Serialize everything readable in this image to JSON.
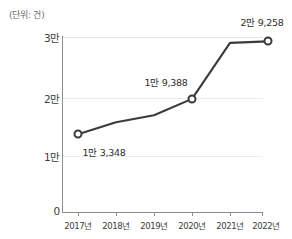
{
  "chart_data": {
    "type": "line",
    "title": "",
    "unit_note": "(단위: 건)",
    "xlabel": "",
    "ylabel": "",
    "grid": true,
    "legend": "none",
    "categories": [
      "2017년",
      "2018년",
      "2019년",
      "2020년",
      "2021년",
      "2022년"
    ],
    "series": [
      {
        "name": "건수",
        "values": [
          13348,
          15400,
          16600,
          19388,
          29000,
          29258
        ]
      }
    ],
    "ylim": [
      0,
      30000
    ],
    "ytick_values": [
      0,
      10000,
      20000,
      30000
    ],
    "ytick_labels": [
      "0",
      "1만",
      "2만",
      "3만"
    ],
    "point_labels": [
      {
        "index": 0,
        "text": "1만 3,348",
        "value": 13348
      },
      {
        "index": 3,
        "text": "1만 9,388",
        "value": 19388
      },
      {
        "index": 5,
        "text": "2만 9,258",
        "value": 29258
      }
    ],
    "marker_indices": [
      0,
      3,
      5
    ],
    "line_color": "#3b3b3b",
    "grid_color": "#eceaea",
    "axis_color": "#8e8e8e",
    "background_color": "#ffffff"
  }
}
